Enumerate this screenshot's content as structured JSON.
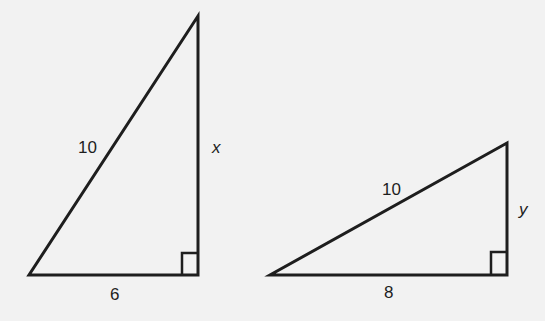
{
  "figure": {
    "stroke_color": "#1e1e1e",
    "background_color": "#f2f2f2"
  },
  "triangles": [
    {
      "id": "left-triangle",
      "hypotenuse_label": "10",
      "base_label": "6",
      "vertical_label": "x",
      "right_angle": true,
      "vertices": {
        "top": [
          198,
          16
        ],
        "bottom_left": [
          29,
          275
        ],
        "bottom_right": [
          198,
          275
        ]
      }
    },
    {
      "id": "right-triangle",
      "hypotenuse_label": "10",
      "base_label": "8",
      "vertical_label": "y",
      "right_angle": true,
      "vertices": {
        "top": [
          507,
          143
        ],
        "bottom_left": [
          270,
          275
        ],
        "bottom_right": [
          507,
          275
        ]
      }
    }
  ]
}
